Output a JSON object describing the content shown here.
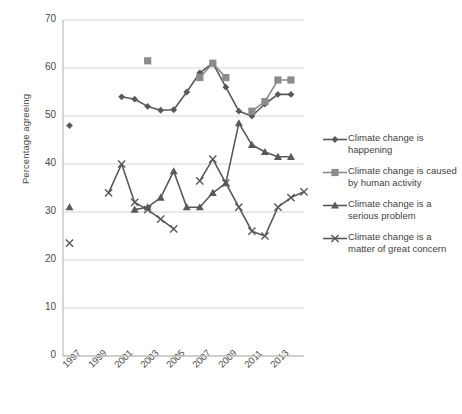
{
  "chart_data": {
    "type": "line",
    "title": "",
    "xlabel": "",
    "ylabel": "Percentage agreeing",
    "ylim": [
      0,
      70
    ],
    "ytick_values": [
      0,
      10,
      20,
      30,
      40,
      50,
      60,
      70
    ],
    "xlim": [
      1997,
      2014
    ],
    "x": [
      1997,
      1998,
      1999,
      2000,
      2001,
      2002,
      2003,
      2004,
      2005,
      2006,
      2007,
      2008,
      2009,
      2010,
      2011,
      2012,
      2013,
      2014
    ],
    "xtick_labels": [
      "1997",
      "1999",
      "2001",
      "2003",
      "2005",
      "2007",
      "2009",
      "2011",
      "2013"
    ],
    "xtick_values": [
      1997,
      1999,
      2001,
      2003,
      2005,
      2007,
      2009,
      2011,
      2013
    ],
    "grid": "horizontal",
    "legend_position": "right",
    "series": [
      {
        "name": "Climate change is happening",
        "marker": "diamond",
        "color": "#595959",
        "points": [
          {
            "x": 1997,
            "y": 48
          },
          {
            "x": 2001,
            "y": 54
          },
          {
            "x": 2002,
            "y": 53.5
          },
          {
            "x": 2003,
            "y": 52
          },
          {
            "x": 2004,
            "y": 51.2
          },
          {
            "x": 2005,
            "y": 51.3
          },
          {
            "x": 2006,
            "y": 55
          },
          {
            "x": 2007,
            "y": 59
          },
          {
            "x": 2008,
            "y": 61
          },
          {
            "x": 2009,
            "y": 56
          },
          {
            "x": 2010,
            "y": 51
          },
          {
            "x": 2011,
            "y": 50
          },
          {
            "x": 2012,
            "y": 52.5
          },
          {
            "x": 2013,
            "y": 54.5
          },
          {
            "x": 2014,
            "y": 54.5
          }
        ]
      },
      {
        "name": "Climate change is caused by human activity",
        "marker": "square",
        "color": "#8c8c8c",
        "points": [
          {
            "x": 2003,
            "y": 61.5
          },
          {
            "x": 2007,
            "y": 58
          },
          {
            "x": 2008,
            "y": 61
          },
          {
            "x": 2009,
            "y": 58
          },
          {
            "x": 2011,
            "y": 51
          },
          {
            "x": 2012,
            "y": 53
          },
          {
            "x": 2013,
            "y": 57.5
          },
          {
            "x": 2014,
            "y": 57.5
          }
        ]
      },
      {
        "name": "Climate change is a serious problem",
        "marker": "triangle",
        "color": "#595959",
        "points": [
          {
            "x": 1997,
            "y": 31
          },
          {
            "x": 2002,
            "y": 30.5
          },
          {
            "x": 2003,
            "y": 31
          },
          {
            "x": 2004,
            "y": 33
          },
          {
            "x": 2005,
            "y": 38.5
          },
          {
            "x": 2006,
            "y": 31
          },
          {
            "x": 2007,
            "y": 31
          },
          {
            "x": 2008,
            "y": 34
          },
          {
            "x": 2009,
            "y": 36
          },
          {
            "x": 2010,
            "y": 48.5
          },
          {
            "x": 2011,
            "y": 44
          },
          {
            "x": 2012,
            "y": 42.5
          },
          {
            "x": 2013,
            "y": 41.5
          },
          {
            "x": 2014,
            "y": 41.5
          }
        ]
      },
      {
        "name": "Climate change is a matter of great concern",
        "marker": "cross",
        "color": "#595959",
        "points": [
          {
            "x": 1997,
            "y": 23.5
          },
          {
            "x": 2000,
            "y": 34
          },
          {
            "x": 2001,
            "y": 40
          },
          {
            "x": 2002,
            "y": 32
          },
          {
            "x": 2003,
            "y": 30.5
          },
          {
            "x": 2004,
            "y": 28.5
          },
          {
            "x": 2005,
            "y": 26.5
          },
          {
            "x": 2007,
            "y": 36.5
          },
          {
            "x": 2008,
            "y": 41
          },
          {
            "x": 2009,
            "y": 36
          },
          {
            "x": 2010,
            "y": 31
          },
          {
            "x": 2011,
            "y": 26
          },
          {
            "x": 2012,
            "y": 25
          },
          {
            "x": 2013,
            "y": 31
          },
          {
            "x": 2014,
            "y": 33
          },
          {
            "x": 2015,
            "y": 34.2
          }
        ]
      }
    ]
  },
  "axis": {
    "y_title": "Percentage agreeing"
  },
  "legend": {
    "items": [
      {
        "label_line1": "Climate change is",
        "label_line2": "happening",
        "marker": "diamond",
        "color": "#595959"
      },
      {
        "label_line1": "Climate change is caused",
        "label_line2": "by human activity",
        "marker": "square",
        "color": "#8c8c8c"
      },
      {
        "label_line1": "Climate change is a",
        "label_line2": "serious problem",
        "marker": "triangle",
        "color": "#595959"
      },
      {
        "label_line1": "Climate change is a",
        "label_line2": "matter of great concern",
        "marker": "cross",
        "color": "#595959"
      }
    ]
  }
}
